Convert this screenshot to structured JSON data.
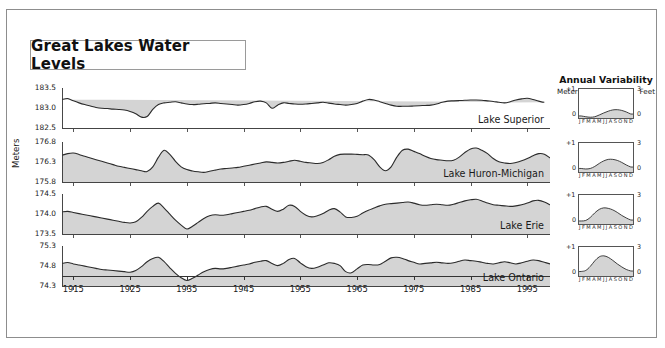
{
  "title": "Great Lakes Water Levels",
  "axis": {
    "meters_label": "Meters",
    "year_ticks": [
      "1915",
      "1925",
      "1935",
      "1945",
      "1955",
      "1965",
      "1975",
      "1985",
      "1995"
    ],
    "x_start_year": 1913,
    "x_end_year": 1999
  },
  "annual_variability": {
    "heading": "Annual Variability",
    "left_unit": "Meters",
    "right_unit": "Feet",
    "left_top": "+1",
    "left_bottom": "0",
    "right_top": "3",
    "right_bottom": "0",
    "months": [
      "J",
      "F",
      "M",
      "A",
      "M",
      "J",
      "J",
      "A",
      "S",
      "O",
      "N",
      "D"
    ]
  },
  "colors": {
    "fill": "#d4d4d4",
    "line": "#2b2b2b",
    "frame": "#8d8d8d",
    "text": "#1a1a1a"
  },
  "chart_data": {
    "type": "area",
    "title": "Great Lakes Water Levels",
    "xlabel": "",
    "ylabel": "Meters",
    "grid": false,
    "legend": "inline-right",
    "x": [
      1913,
      1914,
      1915,
      1916,
      1917,
      1918,
      1919,
      1920,
      1921,
      1922,
      1923,
      1924,
      1925,
      1926,
      1927,
      1928,
      1929,
      1930,
      1931,
      1932,
      1933,
      1934,
      1935,
      1936,
      1937,
      1938,
      1939,
      1940,
      1941,
      1942,
      1943,
      1944,
      1945,
      1946,
      1947,
      1948,
      1949,
      1950,
      1951,
      1952,
      1953,
      1954,
      1955,
      1956,
      1957,
      1958,
      1959,
      1960,
      1961,
      1962,
      1963,
      1964,
      1965,
      1966,
      1967,
      1968,
      1969,
      1970,
      1971,
      1972,
      1973,
      1974,
      1975,
      1976,
      1977,
      1978,
      1979,
      1980,
      1981,
      1982,
      1983,
      1984,
      1985,
      1986,
      1987,
      1988,
      1989,
      1990,
      1991,
      1992,
      1993,
      1994,
      1995,
      1996,
      1997,
      1998,
      1999
    ],
    "panels": [
      {
        "name": "Lake Superior",
        "ylabel_ticks": [
          "183.5",
          "183.0",
          "182.5"
        ],
        "ylim": [
          182.3,
          183.7
        ],
        "values": [
          183.3,
          183.33,
          183.25,
          183.18,
          183.12,
          183.07,
          183.02,
          182.99,
          182.98,
          182.96,
          182.95,
          182.93,
          182.88,
          182.8,
          182.68,
          182.7,
          182.95,
          183.12,
          183.18,
          183.2,
          183.22,
          183.18,
          183.14,
          183.12,
          183.13,
          183.15,
          183.16,
          183.18,
          183.16,
          183.14,
          183.12,
          183.1,
          183.12,
          183.16,
          183.22,
          183.24,
          183.18,
          182.99,
          183.1,
          183.18,
          183.16,
          183.14,
          183.13,
          183.14,
          183.16,
          183.18,
          183.2,
          183.17,
          183.14,
          183.12,
          183.1,
          183.12,
          183.16,
          183.24,
          183.3,
          183.28,
          183.22,
          183.16,
          183.1,
          183.06,
          183.06,
          183.06,
          183.07,
          183.08,
          183.09,
          183.1,
          183.14,
          183.2,
          183.24,
          183.25,
          183.26,
          183.27,
          183.28,
          183.28,
          183.27,
          183.25,
          183.23,
          183.2,
          183.18,
          183.22,
          183.28,
          183.32,
          183.34,
          183.3,
          183.24,
          183.2,
          183.22,
          183.26,
          183.3,
          183.26,
          183.2
        ]
      },
      {
        "name": "Lake Huron-Michigan",
        "ylabel_ticks": [
          "176.8",
          "176.3",
          "175.8"
        ],
        "ylim": [
          175.55,
          177.0
        ],
        "values": [
          176.52,
          176.58,
          176.6,
          176.55,
          176.48,
          176.42,
          176.36,
          176.3,
          176.24,
          176.18,
          176.12,
          176.08,
          176.04,
          176.0,
          175.96,
          175.93,
          176.1,
          176.45,
          176.7,
          176.55,
          176.3,
          176.1,
          176.0,
          175.95,
          175.92,
          175.9,
          175.94,
          175.98,
          176.02,
          176.04,
          176.06,
          176.08,
          176.12,
          176.16,
          176.2,
          176.24,
          176.28,
          176.26,
          176.24,
          176.26,
          176.3,
          176.34,
          176.3,
          176.26,
          176.24,
          176.22,
          176.26,
          176.36,
          176.48,
          176.55,
          176.56,
          176.56,
          176.55,
          176.54,
          176.53,
          176.36,
          176.1,
          175.96,
          176.1,
          176.45,
          176.7,
          176.74,
          176.66,
          176.58,
          176.48,
          176.4,
          176.36,
          176.34,
          176.32,
          176.34,
          176.45,
          176.62,
          176.75,
          176.78,
          176.7,
          176.58,
          176.4,
          176.28,
          176.24,
          176.22,
          176.26,
          176.32,
          176.4,
          176.5,
          176.58,
          176.56,
          176.42
        ]
      },
      {
        "name": "Lake Erie",
        "ylabel_ticks": [
          "174.5",
          "174.0",
          "173.5"
        ],
        "ylim": [
          173.3,
          174.75
        ],
        "values": [
          174.1,
          174.12,
          174.08,
          174.04,
          174.0,
          173.96,
          173.92,
          173.88,
          173.84,
          173.8,
          173.76,
          173.72,
          173.7,
          173.74,
          173.9,
          174.12,
          174.3,
          174.42,
          174.24,
          174.02,
          173.8,
          173.62,
          173.48,
          173.58,
          173.72,
          173.86,
          173.96,
          174.0,
          173.98,
          174.0,
          174.04,
          174.08,
          174.12,
          174.16,
          174.22,
          174.28,
          174.3,
          174.2,
          174.12,
          174.2,
          174.34,
          174.3,
          174.12,
          173.98,
          173.92,
          173.96,
          174.04,
          174.16,
          174.22,
          174.1,
          173.92,
          173.9,
          173.94,
          174.06,
          174.16,
          174.24,
          174.32,
          174.38,
          174.4,
          174.42,
          174.44,
          174.46,
          174.42,
          174.36,
          174.34,
          174.36,
          174.38,
          174.36,
          174.34,
          174.38,
          174.44,
          174.5,
          174.54,
          174.56,
          174.5,
          174.42,
          174.36,
          174.34,
          174.32,
          174.3,
          174.32,
          174.36,
          174.42,
          174.5,
          174.52,
          174.46,
          174.36
        ]
      },
      {
        "name": "Lake Ontario",
        "ylabel_ticks": [
          "75.3",
          "74.8",
          "74.3"
        ],
        "ylim": [
          74.1,
          75.55
        ],
        "values": [
          74.92,
          74.95,
          74.9,
          74.86,
          74.82,
          74.78,
          74.74,
          74.7,
          74.68,
          74.66,
          74.64,
          74.62,
          74.6,
          74.66,
          74.8,
          74.98,
          75.1,
          75.14,
          74.98,
          74.76,
          74.56,
          74.4,
          74.3,
          74.38,
          74.5,
          74.62,
          74.7,
          74.74,
          74.72,
          74.74,
          74.78,
          74.82,
          74.86,
          74.9,
          74.96,
          75.0,
          75.02,
          74.92,
          74.84,
          74.92,
          75.06,
          75.1,
          74.94,
          74.8,
          74.74,
          74.78,
          74.86,
          74.94,
          74.92,
          74.84,
          74.62,
          74.58,
          74.72,
          74.86,
          74.88,
          74.86,
          74.88,
          75.0,
          75.12,
          75.14,
          75.1,
          75.02,
          74.96,
          74.9,
          74.92,
          74.94,
          74.96,
          74.94,
          74.92,
          74.94,
          75.0,
          75.04,
          75.02,
          75.0,
          74.96,
          74.92,
          74.9,
          74.94,
          74.98,
          74.94,
          74.9,
          74.94,
          75.0,
          75.04,
          75.02,
          74.96,
          74.9
        ]
      }
    ],
    "variability_panels": [
      {
        "lake": "Lake Superior",
        "monthly_meters": [
          0.08,
          0.05,
          0.03,
          0.05,
          0.12,
          0.2,
          0.27,
          0.32,
          0.33,
          0.3,
          0.24,
          0.16
        ]
      },
      {
        "lake": "Lake Huron-Michigan",
        "monthly_meters": [
          0.14,
          0.12,
          0.14,
          0.22,
          0.34,
          0.44,
          0.5,
          0.5,
          0.46,
          0.38,
          0.28,
          0.2
        ]
      },
      {
        "lake": "Lake Erie",
        "monthly_meters": [
          0.12,
          0.14,
          0.26,
          0.44,
          0.58,
          0.64,
          0.62,
          0.56,
          0.46,
          0.34,
          0.24,
          0.16
        ]
      },
      {
        "lake": "Lake Ontario",
        "monthly_meters": [
          0.18,
          0.22,
          0.38,
          0.6,
          0.76,
          0.8,
          0.74,
          0.62,
          0.48,
          0.36,
          0.26,
          0.2
        ]
      }
    ]
  }
}
